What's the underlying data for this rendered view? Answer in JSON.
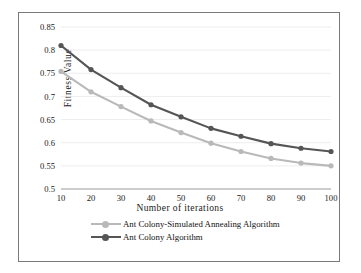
{
  "chart_data": {
    "type": "line",
    "title": "",
    "xlabel": "Number of  iterations",
    "ylabel": "Fitness  Value",
    "x": [
      10,
      20,
      30,
      40,
      50,
      60,
      70,
      80,
      90,
      100
    ],
    "xtick_labels": [
      "10",
      "20",
      "30",
      "40",
      "50",
      "60",
      "70",
      "80",
      "90",
      "100"
    ],
    "ytick_labels": [
      "0.85",
      "0.8",
      "0.75",
      "0.7",
      "0.65",
      "0.6",
      "0.55",
      "0.5"
    ],
    "yticks": [
      0.85,
      0.8,
      0.75,
      0.7,
      0.65,
      0.6,
      0.55,
      0.5
    ],
    "xlim": [
      10,
      100
    ],
    "ylim": [
      0.5,
      0.85
    ],
    "grid": true,
    "legend_position": "bottom",
    "series": [
      {
        "name": "Ant Colony-Simulated Annealing Algorithm",
        "color": "#b9b9b9",
        "marker": "circle",
        "values": [
          0.754,
          0.71,
          0.678,
          0.647,
          0.622,
          0.599,
          0.581,
          0.566,
          0.556,
          0.55
        ]
      },
      {
        "name": "Ant Colony Algorithm",
        "color": "#555555",
        "marker": "circle",
        "values": [
          0.81,
          0.758,
          0.719,
          0.682,
          0.656,
          0.631,
          0.614,
          0.598,
          0.588,
          0.581
        ]
      }
    ]
  },
  "legend": {
    "items": [
      {
        "label": "Ant Colony-Simulated Annealing Algorithm",
        "color": "#b9b9b9"
      },
      {
        "label": "Ant Colony Algorithm",
        "color": "#555555"
      }
    ]
  },
  "axis": {
    "x_title": "Number of  iterations",
    "y_title": "Fitness  Value"
  }
}
